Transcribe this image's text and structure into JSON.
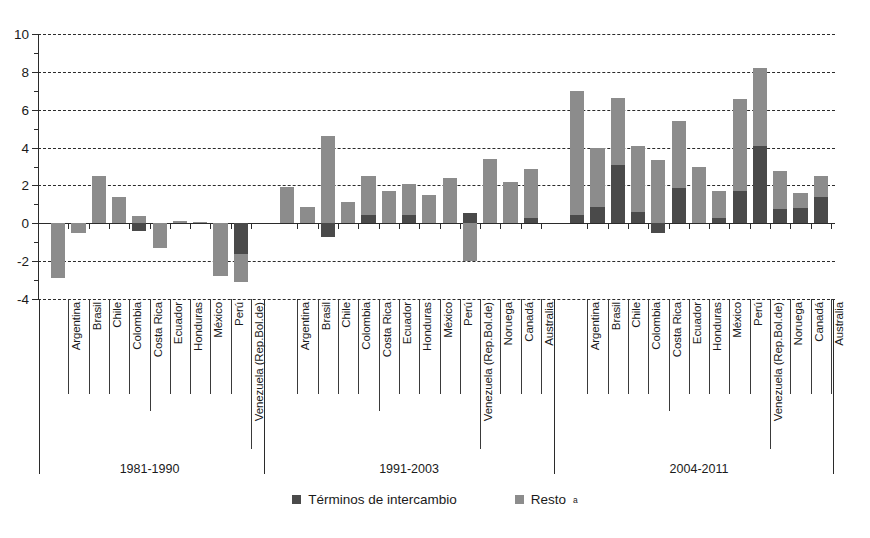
{
  "chart_data": {
    "type": "bar",
    "stacked": true,
    "title": "",
    "xlabel": "",
    "ylabel": "",
    "ylim": [
      -4,
      10
    ],
    "yticks": [
      -4,
      -2,
      0,
      2,
      4,
      6,
      8,
      10
    ],
    "ytick_labels": [
      "-4",
      "-2",
      "0",
      "2",
      "4",
      "6",
      "8",
      "10"
    ],
    "grid": "horizontal-dashed",
    "legend_position": "bottom-center",
    "series": [
      {
        "name": "Términos de intercambio",
        "color": "#4a4a4a"
      },
      {
        "name": "Resto",
        "color": "#8c8c8c"
      }
    ],
    "groups": [
      {
        "label": "1981-1990",
        "categories": [
          "Argentina",
          "Brasil",
          "Chile",
          "Colombia",
          "Costa Rica",
          "Ecuador",
          "Honduras",
          "México",
          "Perú",
          "Venezuela (Rep.Bol.de)"
        ],
        "terminos_de_intercambio": [
          0.0,
          0.0,
          0.0,
          0.0,
          -0.4,
          0.0,
          0.0,
          0.0,
          0.0,
          -1.6
        ],
        "resto": [
          -2.9,
          -0.5,
          2.5,
          1.4,
          0.4,
          -1.3,
          0.1,
          0.05,
          -2.8,
          -1.5
        ],
        "totals": [
          -2.9,
          -0.5,
          2.5,
          1.4,
          0.4,
          -1.3,
          0.1,
          0.05,
          -2.8,
          -3.1
        ]
      },
      {
        "label": "1991-2003",
        "categories": [
          "Argentina",
          "Brasil",
          "Chile",
          "Colombia",
          "Costa Rica",
          "Ecuador",
          "Honduras",
          "México",
          "Perú",
          "Venezuela (Rep.Bol.de)",
          "Noruega",
          "Canadá",
          "Australia"
        ],
        "terminos_de_intercambio": [
          0.0,
          0.0,
          -0.7,
          0.0,
          0.45,
          0.0,
          0.45,
          0.0,
          0.0,
          0.55,
          0.0,
          0.0,
          0.3
        ],
        "resto": [
          1.9,
          0.85,
          4.6,
          1.1,
          2.05,
          1.7,
          1.65,
          1.5,
          2.4,
          -2.0,
          3.4,
          2.2,
          2.55
        ],
        "totals": [
          1.9,
          0.85,
          4.6,
          1.1,
          2.5,
          1.7,
          2.1,
          1.5,
          2.4,
          -1.45,
          3.4,
          2.2,
          2.85
        ]
      },
      {
        "label": "2004-2011",
        "categories": [
          "Argentina",
          "Brasil",
          "Chile",
          "Colombia",
          "Costa Rica",
          "Ecuador",
          "Honduras",
          "México",
          "Perú",
          "Venezuela (Rep.Bol.de)",
          "Noruega",
          "Canadá",
          "Australia"
        ],
        "terminos_de_intercambio": [
          0.45,
          0.85,
          3.1,
          0.6,
          -0.5,
          1.85,
          0.0,
          0.3,
          1.7,
          4.1,
          0.75,
          0.8,
          1.4
        ],
        "resto": [
          6.55,
          3.15,
          3.5,
          3.5,
          3.35,
          3.55,
          3.0,
          1.4,
          4.85,
          4.1,
          2.0,
          0.8,
          1.1
        ],
        "totals": [
          7.0,
          4.0,
          6.6,
          4.1,
          3.35,
          5.4,
          3.0,
          1.7,
          6.55,
          8.2,
          2.75,
          1.6,
          2.5
        ]
      }
    ]
  },
  "legend": {
    "items": [
      {
        "label": "Términos de intercambio",
        "marker": "dark-square-swatch",
        "sup": ""
      },
      {
        "label": "Resto",
        "marker": "light-square-swatch",
        "sup": "a"
      }
    ]
  }
}
